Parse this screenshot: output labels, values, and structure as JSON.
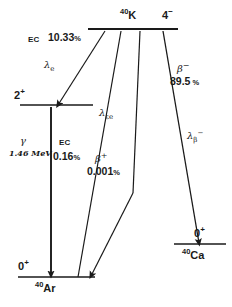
{
  "diagram": {
    "line_color": "#1a1a1a",
    "background": "#ffffff"
  },
  "levels": {
    "parent": {
      "nuclide_mass": "40",
      "nuclide_symbol": "K",
      "spin_parity": "4",
      "spin_parity_sign": "−"
    },
    "argon_excited": {
      "spin_parity": "2",
      "spin_parity_sign": "+"
    },
    "argon_ground": {
      "spin_parity": "0",
      "spin_parity_sign": "+",
      "nuclide_mass": "40",
      "nuclide_symbol": "Ar"
    },
    "calcium_ground": {
      "spin_parity": "0",
      "spin_parity_sign": "+",
      "nuclide_mass": "40",
      "nuclide_symbol": "Ca"
    }
  },
  "transitions": {
    "ec_excited": {
      "mode": "EC",
      "branch": "10.33",
      "percent_sign": "%",
      "rate_symbol": "λ",
      "rate_sub": "e"
    },
    "gamma": {
      "symbol": "γ",
      "energy": "1.46 MeV"
    },
    "ec_ground": {
      "mode": "EC",
      "branch": "0.16",
      "percent_sign": "%"
    },
    "ec_ground_rate": {
      "rate_symbol": "λ",
      "rate_sub": "εe"
    },
    "beta_plus": {
      "symbol": "β",
      "sup": "+",
      "branch": "0.001",
      "percent_sign": "%"
    },
    "beta_minus": {
      "symbol": "β",
      "sup": "−",
      "branch": "89.5",
      "percent_sign": "%",
      "rate_symbol": "λ",
      "rate_sub": "β",
      "rate_sup": "−"
    }
  }
}
